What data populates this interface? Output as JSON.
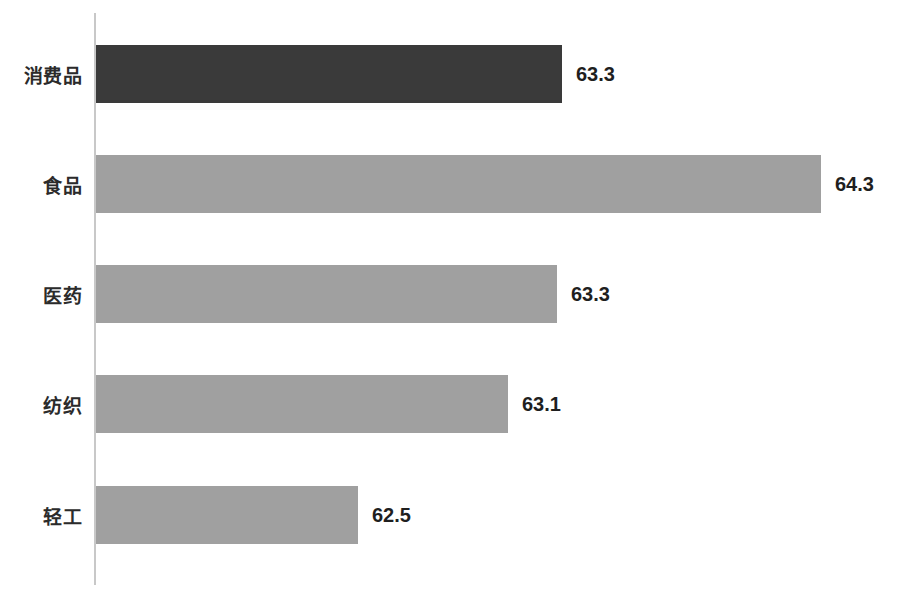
{
  "chart_data": {
    "type": "bar",
    "orientation": "horizontal",
    "title": "",
    "subtitle": "",
    "xlabel": "",
    "ylabel": "",
    "categories": [
      "消费品",
      "食品",
      "医药",
      "纺织",
      "轻工"
    ],
    "values": [
      63.3,
      64.3,
      63.3,
      63.1,
      62.5
    ],
    "value_labels": [
      "63.3",
      "64.3",
      "63.3",
      "63.1",
      "62.5"
    ],
    "xlim": [
      0,
      68.9
    ],
    "grid": false,
    "legend": null,
    "tick_labels": [],
    "bar_colors": [
      "#3a3a3a",
      "#a0a0a0",
      "#a0a0a0",
      "#a0a0a0",
      "#a0a0a0"
    ],
    "highlighted_category": "消费品",
    "axis_color": "#c8c8c8",
    "background": "#ffffff"
  },
  "bars": [
    {
      "category": "消费品",
      "value": 63.3,
      "value_label": "63.3",
      "color": "#3a3a3a",
      "top": 45,
      "width": 466,
      "label_left": 576
    },
    {
      "category": "食品",
      "value": 64.3,
      "value_label": "64.3",
      "color": "#a0a0a0",
      "top": 155,
      "width": 725,
      "label_left": 835
    },
    {
      "category": "医药",
      "value": 63.3,
      "value_label": "63.3",
      "color": "#a0a0a0",
      "top": 265,
      "width": 461,
      "label_left": 571
    },
    {
      "category": "纺织",
      "value": 63.1,
      "value_label": "63.1",
      "color": "#a0a0a0",
      "top": 375,
      "width": 412,
      "label_left": 522
    },
    {
      "category": "轻工",
      "value": 62.5,
      "value_label": "62.5",
      "color": "#a0a0a0",
      "top": 486,
      "width": 262,
      "label_left": 372
    }
  ]
}
